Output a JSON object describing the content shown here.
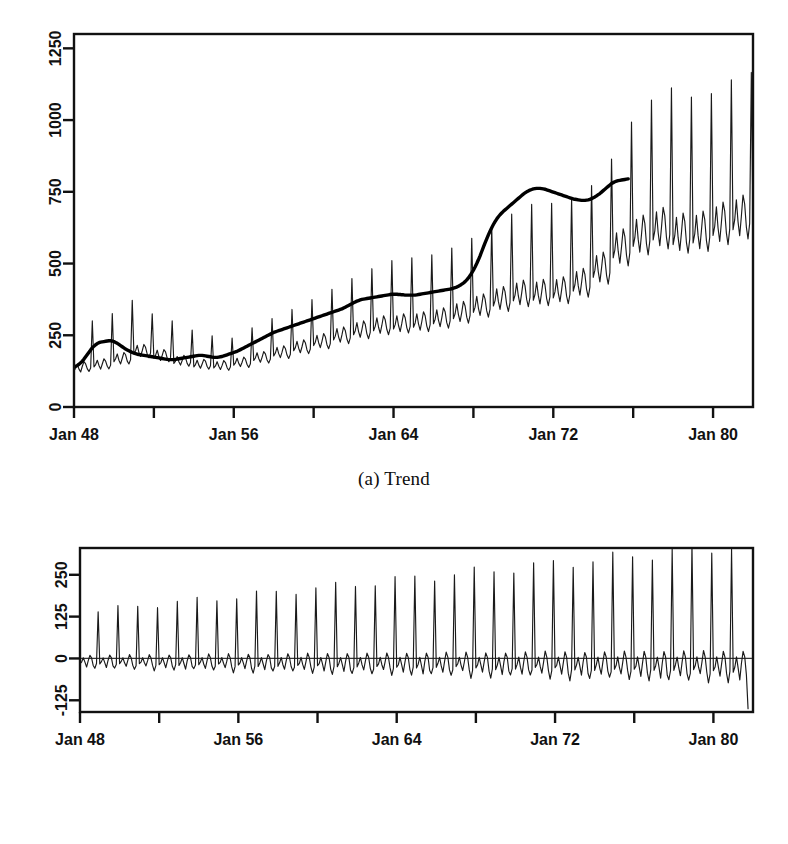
{
  "figure": {
    "background": "#ffffff",
    "ink": "#111111",
    "panels": [
      {
        "id": "a",
        "caption": "(a) Trend"
      },
      {
        "id": "b",
        "caption": "(b) Seasonality"
      }
    ]
  },
  "chart_data": [
    {
      "type": "line",
      "panel": "a",
      "title": "(a) Trend",
      "xlabel": "",
      "ylabel": "",
      "grid": false,
      "legend": "none",
      "xlim": [
        1948.0,
        1982.0
      ],
      "ylim": [
        0,
        1300
      ],
      "ytick_labels": [
        "0",
        "250",
        "500",
        "750",
        "1000",
        "1250"
      ],
      "ytick_values": [
        0,
        250,
        500,
        750,
        1000,
        1250
      ],
      "xtick_values": [
        1948,
        1952,
        1956,
        1960,
        1964,
        1968,
        1972,
        1976,
        1980
      ],
      "xtick_labels": [
        "Jan 48",
        "",
        "Jan 56",
        "",
        "Jan 64",
        "",
        "Jan 72",
        "",
        "Jan 80"
      ],
      "xtick_labels_shown": [
        "Jan 48",
        "Jan 56",
        "Jan 64",
        "Jan 72",
        "Jan 80"
      ],
      "xtick_labels_shown_values": [
        1948,
        1956,
        1964,
        1972,
        1980
      ],
      "series": [
        {
          "name": "observed",
          "style": "thin",
          "x_start": 1948.0,
          "x_step": 0.0833333,
          "values": [
            126,
            135,
            148,
            132,
            122,
            142,
            158,
            150,
            133,
            124,
            136,
            300,
            140,
            148,
            163,
            145,
            132,
            150,
            168,
            160,
            142,
            133,
            146,
            326,
            158,
            168,
            185,
            163,
            150,
            170,
            190,
            182,
            160,
            150,
            165,
            372,
            186,
            196,
            215,
            190,
            176,
            196,
            218,
            208,
            184,
            172,
            188,
            325,
            170,
            180,
            198,
            176,
            162,
            180,
            200,
            192,
            170,
            158,
            172,
            300,
            152,
            160,
            176,
            158,
            146,
            162,
            180,
            172,
            152,
            142,
            155,
            268,
            140,
            148,
            163,
            146,
            135,
            150,
            166,
            160,
            141,
            132,
            144,
            248,
            136,
            143,
            158,
            142,
            131,
            145,
            162,
            155,
            137,
            128,
            140,
            240,
            146,
            154,
            170,
            152,
            141,
            156,
            174,
            167,
            148,
            138,
            151,
            276,
            162,
            171,
            189,
            169,
            156,
            173,
            193,
            185,
            164,
            153,
            167,
            308,
            178,
            188,
            208,
            186,
            172,
            191,
            213,
            204,
            181,
            169,
            184,
            340,
            196,
            207,
            229,
            205,
            189,
            210,
            234,
            224,
            199,
            186,
            202,
            374,
            214,
            226,
            250,
            224,
            207,
            229,
            256,
            245,
            217,
            203,
            221,
            410,
            234,
            247,
            273,
            244,
            226,
            251,
            279,
            267,
            237,
            221,
            241,
            448,
            252,
            266,
            294,
            263,
            243,
            270,
            300,
            288,
            255,
            238,
            260,
            482,
            266,
            281,
            311,
            278,
            257,
            285,
            318,
            304,
            270,
            252,
            275,
            510,
            272,
            287,
            318,
            284,
            263,
            292,
            325,
            311,
            276,
            258,
            281,
            520,
            278,
            293,
            325,
            290,
            268,
            298,
            332,
            318,
            282,
            263,
            287,
            530,
            290,
            306,
            339,
            303,
            280,
            311,
            346,
            332,
            294,
            275,
            300,
            554,
            308,
            325,
            360,
            322,
            298,
            330,
            368,
            352,
            313,
            292,
            319,
            588,
            330,
            348,
            386,
            345,
            319,
            354,
            394,
            377,
            335,
            313,
            341,
            630,
            352,
            371,
            412,
            368,
            340,
            378,
            420,
            402,
            357,
            333,
            364,
            672,
            370,
            390,
            432,
            387,
            357,
            397,
            442,
            423,
            375,
            350,
            382,
            706,
            372,
            392,
            435,
            389,
            359,
            400,
            445,
            426,
            378,
            353,
            385,
            710,
            380,
            401,
            444,
            397,
            367,
            408,
            454,
            435,
            386,
            360,
            393,
            726,
            404,
            426,
            472,
            422,
            390,
            434,
            483,
            462,
            410,
            383,
            418,
            772,
            452,
            477,
            528,
            472,
            436,
            485,
            540,
            517,
            459,
            428,
            468,
            864,
            520,
            548,
            607,
            543,
            501,
            558,
            621,
            594,
            528,
            492,
            538,
            993,
            560,
            590,
            654,
            585,
            540,
            601,
            669,
            640,
            568,
            530,
            579,
            1070,
            582,
            614,
            680,
            608,
            562,
            625,
            696,
            666,
            591,
            551,
            602,
            1112,
            566,
            597,
            661,
            591,
            546,
            607,
            676,
            647,
            574,
            536,
            585,
            1080,
            572,
            603,
            668,
            598,
            552,
            614,
            683,
            654,
            581,
            542,
            592,
            1092,
            598,
            630,
            698,
            624,
            577,
            642,
            714,
            683,
            607,
            566,
            619,
            1140,
            618,
            652,
            722,
            646,
            597,
            664,
            739,
            707,
            628,
            586,
            640,
            1166,
            640,
            675,
            747,
            669,
            618,
            687,
            765,
            732,
            650,
            700
          ]
        },
        {
          "name": "trend-smooth",
          "style": "thick",
          "x_start": 1948.0,
          "x_step": 0.0833333,
          "values": [
            140,
            142,
            145,
            149,
            154,
            160,
            167,
            175,
            183,
            191,
            199,
            206,
            212,
            217,
            221,
            224,
            226,
            227,
            228,
            229,
            230,
            231,
            231,
            230,
            228,
            225,
            222,
            218,
            214,
            210,
            206,
            202,
            199,
            196,
            193,
            190,
            188,
            186,
            184,
            183,
            182,
            181,
            180,
            179,
            178,
            177,
            176,
            175,
            174,
            173,
            172,
            171,
            170,
            169,
            168,
            167,
            166,
            165,
            165,
            165,
            165,
            166,
            167,
            168,
            169,
            170,
            171,
            172,
            173,
            174,
            175,
            176,
            177,
            178,
            179,
            180,
            180,
            180,
            179,
            178,
            177,
            176,
            175,
            174,
            173,
            173,
            173,
            174,
            175,
            176,
            178,
            180,
            182,
            184,
            186,
            188,
            190,
            192,
            194,
            197,
            200,
            203,
            206,
            209,
            212,
            215,
            218,
            221,
            224,
            227,
            230,
            233,
            236,
            239,
            242,
            245,
            248,
            251,
            254,
            257,
            260,
            262,
            264,
            266,
            268,
            270,
            272,
            274,
            276,
            278,
            280,
            282,
            284,
            286,
            288,
            290,
            292,
            294,
            296,
            298,
            300,
            302,
            304,
            306,
            308,
            310,
            312,
            314,
            316,
            318,
            320,
            322,
            324,
            326,
            328,
            330,
            332,
            334,
            336,
            338,
            340,
            342,
            345,
            348,
            351,
            354,
            357,
            360,
            363,
            366,
            369,
            371,
            373,
            375,
            376,
            377,
            378,
            379,
            380,
            381,
            382,
            383,
            384,
            385,
            386,
            387,
            388,
            389,
            390,
            391,
            392,
            393,
            393,
            393,
            393,
            392,
            392,
            391,
            391,
            390,
            390,
            390,
            390,
            390,
            390,
            390,
            391,
            392,
            393,
            394,
            395,
            396,
            397,
            398,
            399,
            400,
            401,
            402,
            403,
            404,
            405,
            406,
            407,
            408,
            409,
            410,
            411,
            412,
            414,
            416,
            418,
            421,
            424,
            428,
            432,
            437,
            443,
            450,
            458,
            467,
            477,
            488,
            500,
            513,
            527,
            542,
            557,
            572,
            586,
            600,
            613,
            625,
            636,
            646,
            655,
            663,
            670,
            676,
            682,
            687,
            692,
            697,
            702,
            707,
            712,
            717,
            722,
            727,
            732,
            737,
            742,
            746,
            750,
            753,
            756,
            758,
            760,
            761,
            762,
            762,
            762,
            761,
            760,
            759,
            757,
            755,
            753,
            751,
            749,
            747,
            745,
            743,
            741,
            739,
            737,
            735,
            733,
            731,
            729,
            727,
            725,
            724,
            723,
            722,
            721,
            720,
            720,
            720,
            721,
            722,
            724,
            726,
            729,
            732,
            736,
            740,
            744,
            749,
            754,
            759,
            764,
            769,
            774,
            779,
            782,
            785,
            787,
            789,
            790,
            791,
            792,
            793,
            794,
            795
          ]
        }
      ]
    },
    {
      "type": "line",
      "panel": "b",
      "title": "(b) Seasonality",
      "xlabel": "",
      "ylabel": "",
      "grid": false,
      "legend": "none",
      "zero_line": true,
      "xlim": [
        1948.0,
        1982.0
      ],
      "ylim": [
        -160,
        330
      ],
      "ytick_labels": [
        "-125",
        "0",
        "125",
        "250"
      ],
      "ytick_values": [
        -125,
        0,
        125,
        250
      ],
      "xtick_values": [
        1948,
        1952,
        1956,
        1960,
        1964,
        1968,
        1972,
        1976,
        1980
      ],
      "xtick_labels": [
        "Jan 48",
        "",
        "Jan 56",
        "",
        "Jan 64",
        "",
        "Jan 72",
        "",
        "Jan 80"
      ],
      "xtick_labels_shown": [
        "Jan 48",
        "Jan 56",
        "Jan 64",
        "Jan 72",
        "Jan 80"
      ],
      "xtick_labels_shown_values": [
        1948,
        1956,
        1964,
        1972,
        1980
      ],
      "series": [
        {
          "name": "seasonal",
          "style": "thin",
          "x_start": 1948.0,
          "x_step": 0.0833333,
          "amplitude_profile": "growing",
          "pattern_per_year": [
            -16,
            -10,
            2,
            -12,
            -24,
            -6,
            10,
            2,
            -20,
            -30,
            -18,
            145
          ],
          "amplitude_scale_start": 0.95,
          "amplitude_scale_end": 2.35,
          "note": "December spike dominates; amplitude grows roughly linearly over the record"
        }
      ]
    }
  ],
  "axes": {
    "panel_a": {
      "y_ticks": [
        {
          "label": "0",
          "value": 0
        },
        {
          "label": "250",
          "value": 250
        },
        {
          "label": "500",
          "value": 500
        },
        {
          "label": "750",
          "value": 750
        },
        {
          "label": "1000",
          "value": 1000
        },
        {
          "label": "1250",
          "value": 1250
        }
      ],
      "x_ticks": [
        {
          "label": "Jan 48",
          "value": 1948
        },
        {
          "label": "",
          "value": 1952
        },
        {
          "label": "Jan 56",
          "value": 1956
        },
        {
          "label": "",
          "value": 1960
        },
        {
          "label": "Jan 64",
          "value": 1964
        },
        {
          "label": "",
          "value": 1968
        },
        {
          "label": "Jan 72",
          "value": 1972
        },
        {
          "label": "",
          "value": 1976
        },
        {
          "label": "Jan 80",
          "value": 1980
        }
      ]
    },
    "panel_b": {
      "y_ticks": [
        {
          "label": "-125",
          "value": -125
        },
        {
          "label": "0",
          "value": 0
        },
        {
          "label": "125",
          "value": 125
        },
        {
          "label": "250",
          "value": 250
        }
      ],
      "x_ticks": [
        {
          "label": "Jan 48",
          "value": 1948
        },
        {
          "label": "",
          "value": 1952
        },
        {
          "label": "Jan 56",
          "value": 1956
        },
        {
          "label": "",
          "value": 1960
        },
        {
          "label": "Jan 64",
          "value": 1964
        },
        {
          "label": "",
          "value": 1968
        },
        {
          "label": "Jan 72",
          "value": 1972
        },
        {
          "label": "",
          "value": 1976
        },
        {
          "label": "Jan 80",
          "value": 1980
        }
      ]
    }
  }
}
